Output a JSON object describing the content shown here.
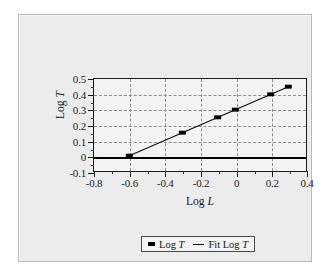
{
  "figure": {
    "background_color": "#ececed",
    "plot_background_color": "#f3f3f3",
    "frame_color": "#b9b9ba"
  },
  "chart_data": {
    "type": "scatter",
    "title": "",
    "xlabel": "Log L",
    "ylabel": "Log T",
    "xlim": [
      -0.8,
      0.4
    ],
    "ylim": [
      -0.1,
      0.5
    ],
    "xticks": [
      -0.8,
      -0.6,
      -0.4,
      -0.2,
      0,
      0.2,
      0.4
    ],
    "xticklabels": [
      "-0.8",
      "-0.6",
      "-0.4",
      "-0.2",
      "0",
      "0.2",
      "0.4"
    ],
    "xtick_minor": [
      -0.7,
      -0.5,
      -0.3,
      -0.1,
      0.1,
      0.3
    ],
    "yticks": [
      -0.1,
      0,
      0.1,
      0.2,
      0.3,
      0.4,
      0.5
    ],
    "yticklabels": [
      "-0.1",
      "0",
      "0.1",
      "0.2",
      "0.3",
      "0.4",
      "0.5"
    ],
    "grid": true,
    "grid_style": "dashed",
    "grid_color": "#8d8d8d",
    "zero_line": 0,
    "zero_line_color": "#000000",
    "legend_position": "below-center",
    "series": [
      {
        "name": "Log T",
        "kind": "markers",
        "marker": "square",
        "color": "#000000",
        "x": [
          -0.6,
          -0.3,
          -0.1,
          0.0,
          0.2,
          0.3
        ],
        "y": [
          0.0,
          0.15,
          0.25,
          0.3,
          0.4,
          0.45
        ]
      },
      {
        "name": "Fit Log T",
        "kind": "line",
        "color": "#111111",
        "x": [
          -0.6,
          0.3
        ],
        "y": [
          0.0,
          0.45
        ],
        "slope": 0.5,
        "intercept": 0.3
      }
    ]
  },
  "legend": {
    "items": [
      {
        "label_prefix": "Log ",
        "label_italic": "T",
        "swatch": "marker-square"
      },
      {
        "label_prefix": "Fit Log ",
        "label_italic": "T",
        "swatch": "line"
      }
    ]
  },
  "axis_titles": {
    "x_prefix": "Log ",
    "x_italic": "L",
    "y_prefix": "Log ",
    "y_italic": "T"
  }
}
